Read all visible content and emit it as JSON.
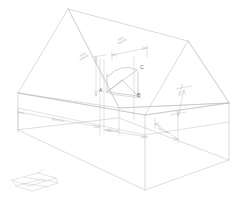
{
  "drawing": {
    "type": "isometric-wireframe",
    "subject": "gable-roof-building-with-interior-truss",
    "background_color": "#ffffff",
    "line_color": "#b9b9be",
    "line_color_strong": "#a6a6ac",
    "line_color_faint": "#cfcfd4",
    "text_color": "#8d8d92"
  },
  "points": [
    {
      "id": "A",
      "label": "A",
      "x": 104,
      "y": 92
    },
    {
      "id": "B",
      "label": "B",
      "x": 139,
      "y": 97
    },
    {
      "id": "C",
      "label": "C",
      "x": 138,
      "y": 69
    }
  ],
  "dimensions": [
    {
      "id": "top-span",
      "label": "1500\n(typical)",
      "text": "1500",
      "sub": "(typical)",
      "x": 124,
      "y": 47,
      "rotate": -28,
      "orientation": "horizontal-iso"
    },
    {
      "id": "left-height",
      "label": "1840\n(typical)",
      "text": "1840",
      "sub": "(typical)",
      "x": 86,
      "y": 58,
      "rotate": -28,
      "orientation": "vertical"
    },
    {
      "id": "long-wall",
      "label": "9250 mm",
      "text": "9250 mm",
      "sub": "",
      "x": 60,
      "y": 122,
      "rotate": 17,
      "orientation": "horizontal-iso"
    },
    {
      "id": "bay-width",
      "label": "3550 mm",
      "text": "3550 mm",
      "sub": "",
      "x": 113,
      "y": 133,
      "rotate": 17,
      "orientation": "horizontal-iso"
    },
    {
      "id": "right-upper",
      "label": "1550 mm",
      "text": "1550 mm",
      "sub": "",
      "x": 180,
      "y": 100,
      "rotate": -74,
      "orientation": "vertical"
    },
    {
      "id": "right-lower",
      "label": "2450 mm",
      "text": "2450 mm",
      "sub": "",
      "x": 166,
      "y": 131,
      "rotate": 17,
      "orientation": "horizontal-iso"
    }
  ],
  "detail_inset": {
    "name": "base-plate-detail",
    "x": 10,
    "y": 170,
    "width": 48,
    "height": 22
  }
}
